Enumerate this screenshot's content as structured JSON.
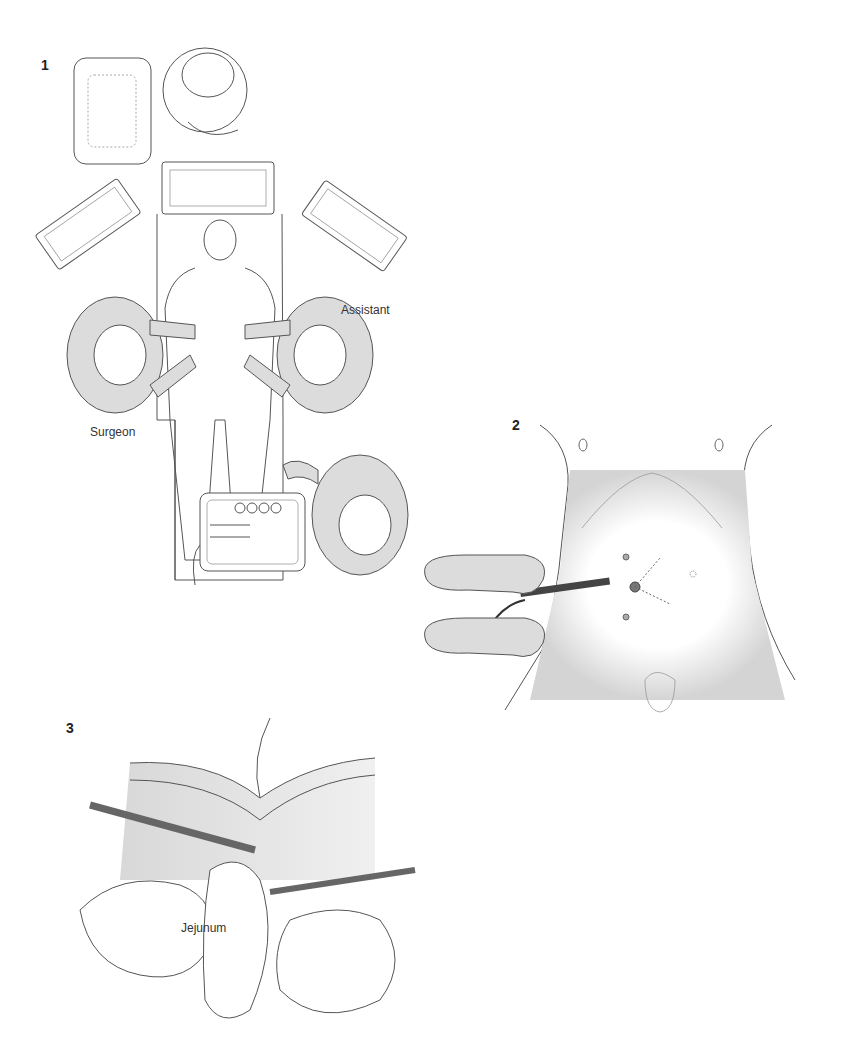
{
  "figures": [
    {
      "number": "1",
      "labels": {
        "surgeon": "Surgeon",
        "assistant": "Assistant"
      }
    },
    {
      "number": "2"
    },
    {
      "number": "3",
      "labels": {
        "jejunum": "Jejunum"
      }
    }
  ],
  "colors": {
    "gown_fill": "#dcdcdc",
    "line": "#555555",
    "shade": "#bdbdbd"
  }
}
